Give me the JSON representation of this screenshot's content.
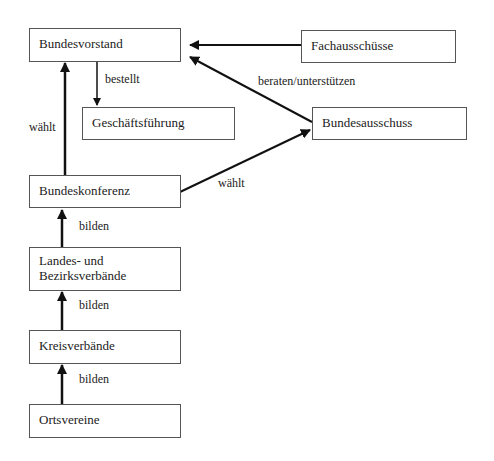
{
  "diagram": {
    "nodes": {
      "bundesvorstand": "Bundesvorstand",
      "fachausschuesse": "Fachausschüsse",
      "geschaeftsfuehrung": "Geschäftsführung",
      "bundesausschuss": "Bundesausschuss",
      "bundeskonferenz": "Bundeskonferenz",
      "landes_line1": "Landes- und",
      "landes_line2": "Bezirksverbände",
      "kreisverbaende": "Kreisverbände",
      "ortsvereine": "Ortsvereine"
    },
    "edges": {
      "bestellt": "bestellt",
      "waehlt_left": "wählt",
      "beraten": "beraten/unterstützen",
      "waehlt_right": "wählt",
      "bilden1": "bilden",
      "bilden2": "bilden",
      "bilden3": "bilden"
    }
  }
}
